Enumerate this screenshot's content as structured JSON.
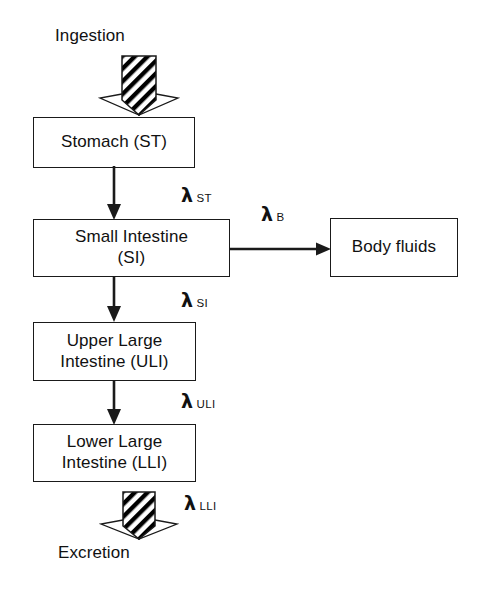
{
  "diagram": {
    "nodes": [
      {
        "id": "stomach",
        "label": "Stomach (ST)"
      },
      {
        "id": "small-intestine",
        "label": "Small Intestine\n(SI)"
      },
      {
        "id": "body-fluids",
        "label": "Body fluids"
      },
      {
        "id": "uli",
        "label": "Upper Large\nIntestine (ULI)"
      },
      {
        "id": "lli",
        "label": "Lower Large\nIntestine (LLI)"
      }
    ],
    "input_label": "Ingestion",
    "output_label": "Excretion",
    "rate_constants": [
      {
        "id": "lambda-st",
        "symbol": "λ",
        "subscript": "ST"
      },
      {
        "id": "lambda-b",
        "symbol": "λ",
        "subscript": "B"
      },
      {
        "id": "lambda-si",
        "symbol": "λ",
        "subscript": "SI"
      },
      {
        "id": "lambda-uli",
        "symbol": "λ",
        "subscript": "ULI"
      },
      {
        "id": "lambda-lli",
        "symbol": "λ",
        "subscript": "LLI"
      }
    ],
    "colors": {
      "stroke": "#1a1a1a",
      "text": "#111111",
      "background": "#ffffff",
      "hatch": "#000000"
    }
  }
}
